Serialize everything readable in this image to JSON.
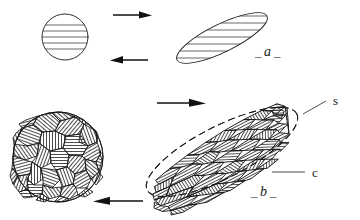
{
  "figure": {
    "background_color": "#ffffff",
    "line_color": "#1a1a1a",
    "hatch_color": "#2a2a2a",
    "grain_fill_color": "#ffffff"
  },
  "labels": {
    "panel_a": "a",
    "panel_a_prefix": "_",
    "panel_a_suffix": "_",
    "panel_b": "b",
    "panel_b_prefix": "_",
    "panel_b_suffix": "_",
    "label_s": "s",
    "label_c": "c"
  },
  "panel_a": {
    "left_shape": {
      "name": "undeformed-grain",
      "type": "circle",
      "cx": 65,
      "cy": 37,
      "r": 23,
      "hatch_orientation_deg": 0,
      "hatch_line_count": 5
    },
    "right_shape": {
      "name": "deformed-grain",
      "type": "ellipse",
      "cx": 222,
      "cy": 38,
      "rx": 50,
      "ry": 14,
      "rotation_deg": -26,
      "hatch_orientation_deg": 0,
      "hatch_line_count": 5
    },
    "arrows": [
      {
        "name": "forward-arrow-a",
        "direction": "right",
        "x1": 113,
        "x2": 150,
        "y": 15
      },
      {
        "name": "reverse-arrow-a",
        "direction": "left",
        "x1": 110,
        "x2": 148,
        "y": 60
      }
    ]
  },
  "panel_b": {
    "left_shape": {
      "name": "undeformed-aggregate",
      "type": "circle",
      "cx": 58,
      "cy": 157,
      "r": 45,
      "grain_count": 33,
      "description": "equant polygonal grains, random hatch orientation"
    },
    "right_shape": {
      "name": "deformed-aggregate",
      "type": "ellipse",
      "cx": 222,
      "cy": 152,
      "rx": 84,
      "ry": 26,
      "rotation_deg": -27,
      "grain_count": 44,
      "description": "elongate grains aligned to long axis, shape and crystallographic fabric"
    },
    "arrows": [
      {
        "name": "forward-arrow-b",
        "direction": "right",
        "x1": 157,
        "x2": 205,
        "y": 103
      },
      {
        "name": "reverse-arrow-b",
        "direction": "left",
        "x1": 94,
        "x2": 143,
        "y": 201
      }
    ],
    "leaders": [
      {
        "name": "leader-s",
        "x1": 300,
        "y1": 113,
        "x2": 325,
        "y2": 101
      },
      {
        "name": "leader-c",
        "x1": 272,
        "y1": 173,
        "x2": 305,
        "y2": 173
      }
    ]
  },
  "label_positions": {
    "a": {
      "x": 268,
      "y": 56
    },
    "b": {
      "x": 262,
      "y": 196
    },
    "s": {
      "x": 334,
      "y": 103
    },
    "c": {
      "x": 313,
      "y": 178
    }
  }
}
